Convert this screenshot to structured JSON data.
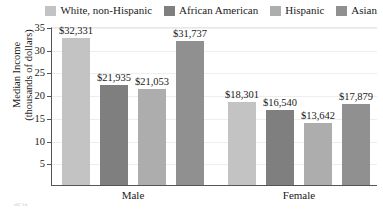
{
  "chart_data": {
    "type": "bar",
    "title": "",
    "xlabel": "",
    "ylabel": "Median Income (thousands of dollars)",
    "ylabel_line1": "Median Income",
    "ylabel_line2": "(thousands of dollars)",
    "ylim": [
      0,
      35
    ],
    "ytick_step": 5,
    "yticks": [
      5,
      10,
      15,
      20,
      25,
      30,
      35
    ],
    "ytick_labels": [
      "5",
      "10",
      "15",
      "20",
      "25",
      "30",
      "35"
    ],
    "grid": true,
    "legend_position": "top-right",
    "categories": [
      "Male",
      "Female"
    ],
    "series": [
      {
        "name": "White, non-Hispanic",
        "color": "#c3c3c3",
        "values": [
          32.331,
          18.301
        ],
        "labels": [
          "$32,331",
          "$18,301"
        ]
      },
      {
        "name": "African American",
        "color": "#7f7f7f",
        "values": [
          21.935,
          16.54
        ],
        "labels": [
          "$21,935",
          "$16,540"
        ]
      },
      {
        "name": "Hispanic",
        "color": "#adadad",
        "values": [
          21.053,
          13.642
        ],
        "labels": [
          "$21,053",
          "$13,642"
        ]
      },
      {
        "name": "Asian",
        "color": "#909090",
        "values": [
          31.737,
          17.879
        ],
        "labels": [
          "$31,737",
          "$17,879"
        ]
      }
    ]
  },
  "legend": {
    "items": [
      {
        "label": "White, non-Hispanic",
        "color": "#c3c3c3"
      },
      {
        "label": "African American",
        "color": "#7f7f7f"
      },
      {
        "label": "Hispanic",
        "color": "#adadad"
      },
      {
        "label": "Asian",
        "color": "#909090"
      }
    ]
  },
  "axes": {
    "y_title_line1": "Median Income",
    "y_title_line2": "(thousands of dollars)",
    "y_tick_labels": [
      "35",
      "30",
      "25",
      "20",
      "15",
      "10",
      "5"
    ],
    "x_group_labels": [
      "Male",
      "Female"
    ]
  },
  "bars": [
    {
      "group": "Male",
      "series": "White, non-Hispanic",
      "value": 32.331,
      "label": "$32,331",
      "color": "#c3c3c3"
    },
    {
      "group": "Male",
      "series": "African American",
      "value": 21.935,
      "label": "$21,935",
      "color": "#7f7f7f"
    },
    {
      "group": "Male",
      "series": "Hispanic",
      "value": 21.053,
      "label": "$21,053",
      "color": "#adadad"
    },
    {
      "group": "Male",
      "series": "Asian",
      "value": 31.737,
      "label": "$31,737",
      "color": "#909090"
    },
    {
      "group": "Female",
      "series": "White, non-Hispanic",
      "value": 18.301,
      "label": "$18,301",
      "color": "#c3c3c3"
    },
    {
      "group": "Female",
      "series": "African American",
      "value": 16.54,
      "label": "$16,540",
      "color": "#7f7f7f"
    },
    {
      "group": "Female",
      "series": "Hispanic",
      "value": 13.642,
      "label": "$13,642",
      "color": "#adadad"
    },
    {
      "group": "Female",
      "series": "Asian",
      "value": 17.879,
      "label": "$17,879",
      "color": "#909090"
    }
  ],
  "footnote": {
    "text": "tâ€˜fit"
  }
}
